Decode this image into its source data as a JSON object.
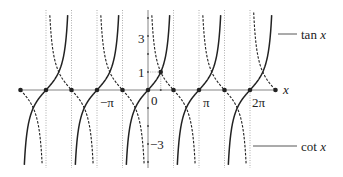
{
  "chart_data": {
    "type": "line",
    "title": "",
    "xlabel": "x",
    "ylabel": "",
    "xlim_radians": [
      -7.854,
      7.854
    ],
    "ylim": [
      -4.4,
      4.4
    ],
    "grid": false,
    "legend_position": "right (annotation leaders)",
    "x_tick_labels": [
      "-π",
      "0",
      "π",
      "2π"
    ],
    "y_tick_labels": [
      "3",
      "1",
      "0",
      "-3"
    ],
    "y_ticks": [
      -4,
      -3,
      -2,
      -1,
      1,
      2,
      3,
      4
    ],
    "series": [
      {
        "name": "tan x",
        "style": "solid",
        "zeros": [
          "-2π",
          "-π",
          "0",
          "π",
          "2π"
        ],
        "asymptotes": [
          "-5π/2",
          "-3π/2",
          "-π/2",
          "π/2",
          "3π/2",
          "5π/2"
        ]
      },
      {
        "name": "cot x",
        "style": "dashed",
        "zeros": [
          "-5π/2",
          "-3π/2",
          "-π/2",
          "π/2",
          "3π/2",
          "5π/2"
        ],
        "asymptotes": [
          "-2π",
          "-π",
          "0",
          "π",
          "2π"
        ]
      }
    ],
    "annotations": [
      {
        "text": "tan x",
        "points_to": "tan x curve"
      },
      {
        "text": "cot x",
        "points_to": "cot x curve"
      },
      {
        "text": "point (π/4, 1) marked with dotted guides"
      }
    ]
  },
  "labels": {
    "x_axis": "x",
    "tick_neg_pi": "−π",
    "tick_zero": "0",
    "tick_pi": "π",
    "tick_two_pi": "2π",
    "y_three": "3",
    "y_one": "1",
    "y_neg_three": "−3",
    "tan_prefix": "tan ",
    "cot_prefix": "cot ",
    "var": "x"
  }
}
